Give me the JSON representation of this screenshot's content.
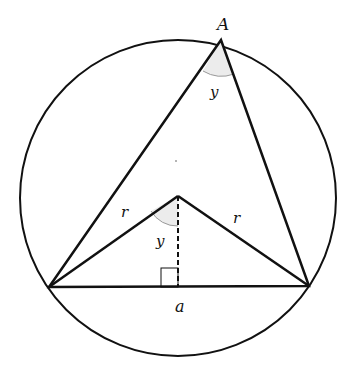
{
  "diagram": {
    "type": "inscribed-triangle-circle",
    "labels": {
      "vertex_top": "A",
      "angle_at_A": "y",
      "radius_left": "r",
      "radius_right": "r",
      "angle_at_center": "y",
      "chord": "a"
    },
    "colors": {
      "stroke": "#111111",
      "angle_fill": "#e8e8e8",
      "angle_arc": "#999999"
    }
  }
}
